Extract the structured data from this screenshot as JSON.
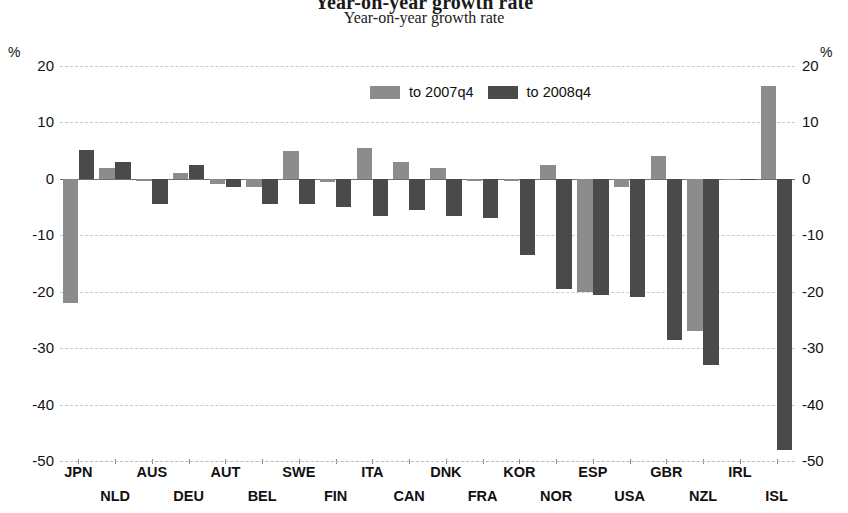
{
  "chart_data": {
    "type": "bar",
    "title": "Year-on-year growth rate",
    "subtitle": "Year-on-year growth rate",
    "xlabel": "",
    "ylabel": "%",
    "ylabel_right": "%",
    "ylim": [
      -50,
      20
    ],
    "yticks": [
      20,
      10,
      0,
      -10,
      -20,
      -30,
      -40,
      -50
    ],
    "ytick_labels": [
      "20",
      "10",
      "0",
      "-10",
      "-20",
      "-30",
      "-40",
      "-50"
    ],
    "grid": true,
    "legend_position": "top-center",
    "categories": [
      "JPN",
      "NLD",
      "AUS",
      "DEU",
      "AUT",
      "BEL",
      "SWE",
      "FIN",
      "ITA",
      "CAN",
      "DNK",
      "FRA",
      "KOR",
      "NOR",
      "ESP",
      "USA",
      "GBR",
      "NZL",
      "IRL",
      "ISL"
    ],
    "series": [
      {
        "name": "to 2007q4",
        "color": "#8c8c8c",
        "values": [
          -22.0,
          2.0,
          -0.4,
          1.0,
          -1.0,
          -1.5,
          5.0,
          -0.5,
          5.5,
          3.0,
          2.0,
          -0.3,
          -0.3,
          2.5,
          -20.0,
          -1.5,
          4.0,
          -27.0,
          -0.2,
          16.4
        ]
      },
      {
        "name": "to 2008q4",
        "color": "#4a4a4a",
        "values": [
          5.2,
          3.0,
          -4.5,
          2.5,
          -1.5,
          -4.5,
          -4.5,
          -5.0,
          -6.5,
          -5.5,
          -6.5,
          -7.0,
          -13.5,
          -19.5,
          -20.5,
          -21.0,
          -28.5,
          -33.0,
          -0.2,
          -48.0
        ]
      }
    ]
  },
  "legend": {
    "items": [
      {
        "label": "to 2007q4",
        "color": "#8c8c8c"
      },
      {
        "label": "to 2008q4",
        "color": "#4a4a4a"
      }
    ]
  },
  "axis": {
    "unit_left": "%",
    "unit_right": "%"
  },
  "colors": {
    "series_2007": "#8c8c8c",
    "series_2008": "#4a4a4a",
    "gridline": "#c9c9c9",
    "text": "#111111"
  }
}
